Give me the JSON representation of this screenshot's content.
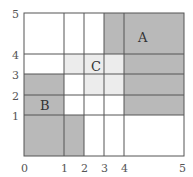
{
  "diagram": {
    "x_ticks": [
      {
        "label": "0",
        "px": 24
      },
      {
        "label": "1",
        "px": 64
      },
      {
        "label": "2",
        "px": 84
      },
      {
        "label": "3",
        "px": 104
      },
      {
        "label": "4",
        "px": 124
      },
      {
        "label": "5",
        "px": 184
      }
    ],
    "y_ticks": [
      {
        "label": "0",
        "px": 156
      },
      {
        "label": "1",
        "px": 115
      },
      {
        "label": "2",
        "px": 95
      },
      {
        "label": "3",
        "px": 74
      },
      {
        "label": "4",
        "px": 54
      },
      {
        "label": "5",
        "px": 13
      }
    ],
    "regions": [
      {
        "label": "A",
        "color": "#b9b9b9",
        "cells": "x3-5,y4-5; x4-5,y1-4"
      },
      {
        "label": "B",
        "color": "#b9b9b9",
        "cells": "x0-1,y1-3; x0-2,y0-1"
      },
      {
        "label": "C",
        "color": "#ececec",
        "cells": "x1-4,y3-4; x2-4,y2-3"
      }
    ],
    "labels": {
      "x0": "0",
      "x1": "1",
      "x2": "2",
      "x3": "3",
      "x4": "4",
      "x5": "5",
      "y1": "1",
      "y2": "2",
      "y3": "3",
      "y4": "4",
      "y5": "5",
      "A": "A",
      "B": "B",
      "C": "C"
    }
  }
}
